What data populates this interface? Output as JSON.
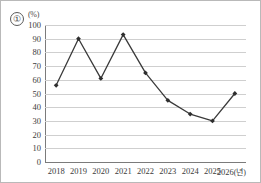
{
  "figure": {
    "item_number": "①",
    "unit_label": "(%)"
  },
  "chart_data": {
    "type": "line",
    "title": "",
    "subtitle": "",
    "xlabel": "",
    "ylabel": "(%)",
    "unit": "(%)",
    "categories": [
      "2018",
      "2019",
      "2020",
      "2021",
      "2022",
      "2023",
      "2024",
      "2025",
      "2026"
    ],
    "x_tick_labels": [
      "2018",
      "2019",
      "2020",
      "2021",
      "2022",
      "2023",
      "2024",
      "2025",
      "2026(년)"
    ],
    "x_axis_suffix": "(년)",
    "values": [
      56,
      90,
      61,
      93,
      65,
      45,
      35,
      30,
      50
    ],
    "series": [
      {
        "name": "",
        "values": [
          56,
          90,
          61,
          93,
          65,
          45,
          35,
          30,
          50
        ]
      }
    ],
    "ylim": [
      0,
      100
    ],
    "y_tick_labels": [
      "0",
      "10",
      "20",
      "30",
      "40",
      "50",
      "60",
      "70",
      "80",
      "90",
      "100"
    ],
    "y_ticks": [
      0,
      10,
      20,
      30,
      40,
      50,
      60,
      70,
      80,
      90,
      100
    ],
    "grid": true,
    "grid_axis": "y",
    "legend": false,
    "legend_position": "none",
    "marker": "diamond",
    "line_color": "#3a3a3a",
    "marker_color": "#2e2e2e",
    "grid_color": "#cfcfcf",
    "axis_color": "#7b7b7b"
  }
}
